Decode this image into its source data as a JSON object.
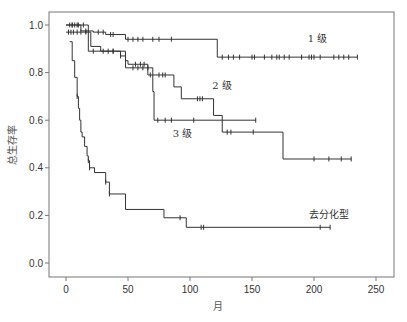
{
  "chart_data": {
    "type": "line",
    "subtype": "kaplan-meier-step",
    "title": "",
    "xlabel": "月",
    "ylabel": "总生存率",
    "xlim": [
      -13,
      265
    ],
    "ylim": [
      -0.06,
      1.06
    ],
    "xticks": [
      0,
      50,
      100,
      150,
      200,
      250
    ],
    "xtick_labels": [
      "0",
      "50",
      "100",
      "150",
      "200",
      "250"
    ],
    "yticks": [
      0.0,
      0.2,
      0.4,
      0.6,
      0.8,
      1.0
    ],
    "ytick_labels": [
      "0.0",
      "0.2",
      "0.4",
      "0.6",
      "0.8",
      "1.0"
    ],
    "grid": false,
    "legend": "inline labels",
    "series": [
      {
        "name": "1 级",
        "label_at": [
          195,
          0.93
        ],
        "steps": [
          [
            0,
            1.0
          ],
          [
            12,
            0.97
          ],
          [
            28,
            0.955
          ],
          [
            45,
            0.94
          ],
          [
            122,
            0.89
          ],
          [
            235,
            0.89
          ]
        ],
        "step_values": [
          [
            0,
            1.0
          ],
          [
            10,
            1.0
          ],
          [
            12,
            0.975
          ],
          [
            22,
            0.97
          ],
          [
            32,
            0.96
          ],
          [
            48,
            0.94
          ],
          [
            122,
            0.94
          ],
          [
            122,
            0.865
          ],
          [
            235,
            0.865
          ]
        ],
        "censored": [
          [
            3,
            1.0
          ],
          [
            5,
            1.0
          ],
          [
            7,
            1.0
          ],
          [
            9,
            1.0
          ],
          [
            16,
            0.975
          ],
          [
            26,
            0.97
          ],
          [
            30,
            0.97
          ],
          [
            36,
            0.96
          ],
          [
            38,
            0.96
          ],
          [
            50,
            0.94
          ],
          [
            54,
            0.94
          ],
          [
            58,
            0.94
          ],
          [
            62,
            0.94
          ],
          [
            70,
            0.94
          ],
          [
            75,
            0.94
          ],
          [
            85,
            0.94
          ],
          [
            126,
            0.865
          ],
          [
            131,
            0.865
          ],
          [
            135,
            0.865
          ],
          [
            140,
            0.865
          ],
          [
            150,
            0.865
          ],
          [
            152,
            0.865
          ],
          [
            160,
            0.865
          ],
          [
            166,
            0.865
          ],
          [
            170,
            0.865
          ],
          [
            172,
            0.865
          ],
          [
            176,
            0.865
          ],
          [
            180,
            0.865
          ],
          [
            190,
            0.865
          ],
          [
            196,
            0.865
          ],
          [
            198,
            0.865
          ],
          [
            200,
            0.865
          ],
          [
            205,
            0.865
          ],
          [
            216,
            0.865
          ],
          [
            220,
            0.865
          ],
          [
            224,
            0.865
          ],
          [
            228,
            0.865
          ],
          [
            235,
            0.865
          ]
        ]
      },
      {
        "name": "2 级",
        "label_at": [
          118,
          0.73
        ],
        "step_values": [
          [
            0,
            0.97
          ],
          [
            20,
            0.97
          ],
          [
            20,
            0.91
          ],
          [
            28,
            0.91
          ],
          [
            28,
            0.89
          ],
          [
            40,
            0.89
          ],
          [
            44,
            0.87
          ],
          [
            48,
            0.85
          ],
          [
            50,
            0.835
          ],
          [
            66,
            0.835
          ],
          [
            66,
            0.79
          ],
          [
            87,
            0.79
          ],
          [
            87,
            0.74
          ],
          [
            93,
            0.74
          ],
          [
            93,
            0.69
          ],
          [
            119,
            0.69
          ],
          [
            119,
            0.62
          ],
          [
            126,
            0.62
          ],
          [
            126,
            0.55
          ],
          [
            175,
            0.55
          ],
          [
            175,
            0.437
          ],
          [
            230,
            0.437
          ]
        ],
        "censored": [
          [
            2,
            0.97
          ],
          [
            4,
            0.97
          ],
          [
            6,
            0.97
          ],
          [
            9,
            0.97
          ],
          [
            12,
            0.97
          ],
          [
            16,
            0.97
          ],
          [
            34,
            0.89
          ],
          [
            38,
            0.89
          ],
          [
            44,
            0.87
          ],
          [
            56,
            0.835
          ],
          [
            60,
            0.835
          ],
          [
            63,
            0.835
          ],
          [
            68,
            0.79
          ],
          [
            75,
            0.79
          ],
          [
            78,
            0.79
          ],
          [
            80,
            0.79
          ],
          [
            106,
            0.69
          ],
          [
            108,
            0.69
          ],
          [
            110,
            0.69
          ],
          [
            130,
            0.55
          ],
          [
            133,
            0.55
          ],
          [
            151,
            0.55
          ],
          [
            200,
            0.437
          ],
          [
            212,
            0.437
          ],
          [
            222,
            0.437
          ],
          [
            230,
            0.437
          ]
        ]
      },
      {
        "name": "3 级",
        "label_at": [
          86,
          0.53
        ],
        "step_values": [
          [
            0,
            1.0
          ],
          [
            18,
            1.0
          ],
          [
            18,
            0.89
          ],
          [
            48,
            0.89
          ],
          [
            48,
            0.82
          ],
          [
            70,
            0.82
          ],
          [
            70,
            0.72
          ],
          [
            71,
            0.72
          ],
          [
            71,
            0.6
          ],
          [
            153,
            0.6
          ]
        ],
        "censored": [
          [
            5,
            1.0
          ],
          [
            10,
            1.0
          ],
          [
            14,
            1.0
          ],
          [
            22,
            0.89
          ],
          [
            30,
            0.89
          ],
          [
            38,
            0.89
          ],
          [
            54,
            0.82
          ],
          [
            58,
            0.82
          ],
          [
            62,
            0.82
          ],
          [
            66,
            0.82
          ],
          [
            74,
            0.6
          ],
          [
            80,
            0.6
          ],
          [
            85,
            0.6
          ],
          [
            103,
            0.6
          ],
          [
            153,
            0.6
          ]
        ]
      },
      {
        "name": "去分化型",
        "label_at": [
          196,
          0.19
        ],
        "step_values": [
          [
            3,
            0.93
          ],
          [
            5,
            0.85
          ],
          [
            7,
            0.78
          ],
          [
            9,
            0.7
          ],
          [
            10,
            0.65
          ],
          [
            11,
            0.6
          ],
          [
            12,
            0.55
          ],
          [
            13,
            0.53
          ],
          [
            15,
            0.49
          ],
          [
            17,
            0.45
          ],
          [
            18,
            0.43
          ],
          [
            19,
            0.4
          ],
          [
            23,
            0.4
          ],
          [
            23,
            0.38
          ],
          [
            32,
            0.38
          ],
          [
            32,
            0.34
          ],
          [
            34,
            0.34
          ],
          [
            35,
            0.29
          ],
          [
            48,
            0.29
          ],
          [
            48,
            0.225
          ],
          [
            79,
            0.225
          ],
          [
            79,
            0.19
          ],
          [
            97,
            0.19
          ],
          [
            97,
            0.15
          ],
          [
            213,
            0.15
          ]
        ],
        "censored": [
          [
            9,
            0.7
          ],
          [
            18,
            0.43
          ],
          [
            19,
            0.4
          ],
          [
            32,
            0.34
          ],
          [
            35,
            0.29
          ],
          [
            92,
            0.19
          ],
          [
            109,
            0.15
          ],
          [
            111,
            0.15
          ],
          [
            205,
            0.15
          ],
          [
            213,
            0.15
          ]
        ]
      }
    ]
  }
}
